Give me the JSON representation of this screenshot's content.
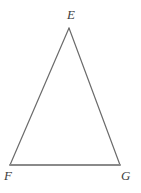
{
  "figure": {
    "kind": "triangle",
    "background_color": "#ffffff",
    "stroke_color": "#6b6b6b",
    "base_stroke_color": "#8a8a8a",
    "label_color": "#3d3d3d",
    "width": 141,
    "height": 193,
    "vertices": [
      {
        "id": "E",
        "label": "E",
        "x": 69,
        "y": 28
      },
      {
        "id": "F",
        "label": "F",
        "x": 10,
        "y": 165
      },
      {
        "id": "G",
        "label": "G",
        "x": 120,
        "y": 165
      }
    ],
    "edges": [
      {
        "id": "EF",
        "from": "E",
        "to": "F",
        "stroke_width": 1.2
      },
      {
        "id": "EG",
        "from": "E",
        "to": "G",
        "stroke_width": 1.2
      },
      {
        "id": "FG",
        "from": "F",
        "to": "G",
        "stroke_width": 1.8
      }
    ],
    "labels": {
      "apex": "E",
      "bottom_left": "F",
      "bottom_right": "G"
    }
  }
}
